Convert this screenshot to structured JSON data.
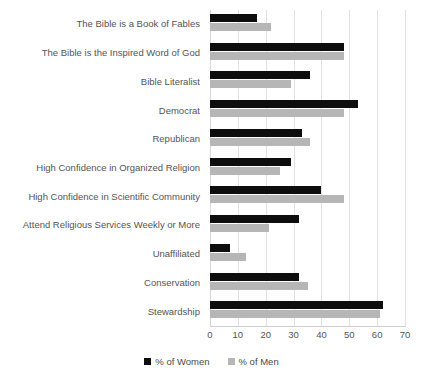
{
  "chart_data": {
    "type": "bar",
    "orientation": "horizontal",
    "title": "",
    "xlabel": "",
    "ylabel": "",
    "xlim": [
      0,
      70
    ],
    "xticks": [
      0,
      10,
      20,
      30,
      40,
      50,
      60,
      70
    ],
    "grid": true,
    "legend_position": "bottom",
    "categories": [
      "The Bible is a Book of Fables",
      "The Bible is the Inspired Word of God",
      "Bible Literalist",
      "Democrat",
      "Republican",
      "High Confidence in Organized Religion",
      "High Confidence in Scientific Community",
      "Attend Religious Services Weekly or More",
      "Unaffiliated",
      "Conservation",
      "Stewardship"
    ],
    "series": [
      {
        "name": "% of Women",
        "color": "#0d0d0d",
        "values": [
          17,
          48,
          36,
          53,
          33,
          29,
          40,
          32,
          7,
          32,
          62
        ]
      },
      {
        "name": "% of Men",
        "color": "#b6b6b6",
        "values": [
          22,
          48,
          29,
          48,
          36,
          25,
          48,
          21,
          13,
          35,
          61
        ]
      }
    ]
  },
  "legend": {
    "items": [
      {
        "label": "% of Women",
        "color": "#0d0d0d",
        "icon": "square-swatch-icon"
      },
      {
        "label": "% of Men",
        "color": "#b6b6b6",
        "icon": "square-swatch-icon"
      }
    ]
  }
}
